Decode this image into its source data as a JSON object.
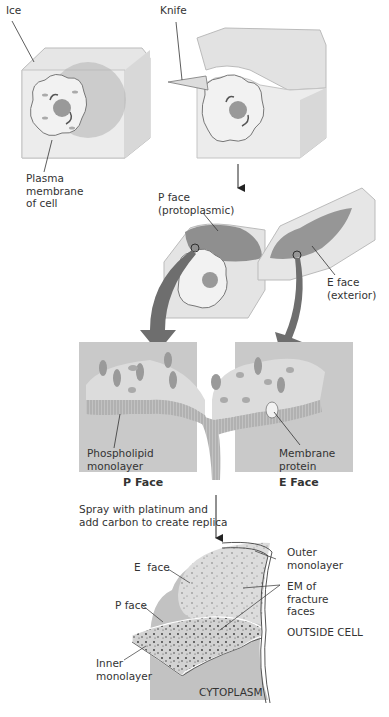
{
  "step1": {
    "ice_label": "Ice",
    "plasma_label": "Plasma\nmembrane\nof cell"
  },
  "step2": {
    "knife_label": "Knife"
  },
  "step3": {
    "p_face_label": "P face\n(protoplasmic)",
    "e_face_label": "E face\n(exterior)"
  },
  "step4": {
    "phospholipid_label": "Phospholipid\nmonolayer",
    "membrane_protein_label": "Membrane\nprotein",
    "p_face_caption": "P Face",
    "e_face_caption": "E Face"
  },
  "step5": {
    "instruction": "Spray with platinum and\nadd carbon to create replica"
  },
  "step6": {
    "outer_label": "Outer\nmonolayer",
    "e_face_label": "E  face",
    "em_label": "EM of\nfracture\nfaces",
    "p_face_label": "P face",
    "outside_label": "OUTSIDE CELL",
    "inner_label": "Inner\nmonolayer",
    "cytoplasm_label": "CYTOPLASM"
  },
  "colors": {
    "ice": "#e3e3e3",
    "ice_dark": "#c9c9c9",
    "panel": "#c8c8c8",
    "arrow": "#6e6e6e",
    "membrane_face": "#9a9a9a"
  }
}
